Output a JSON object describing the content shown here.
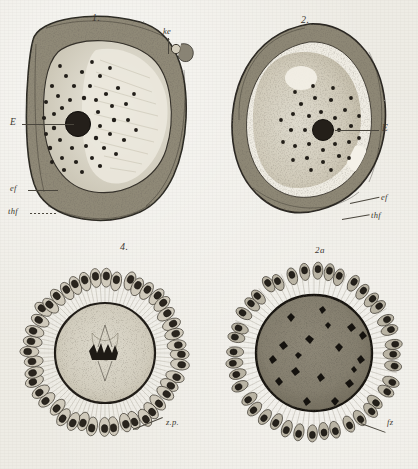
{
  "plate": {
    "title": "Histological plate of ovarian follicle sections",
    "background_color": "#eeece5",
    "ink_color": "#2b2823",
    "width": 418,
    "height": 469
  },
  "panels": [
    {
      "id": "panel-1",
      "fignum": "1.",
      "description": "Sectioned ovarian follicle with eccentric oocyte, dark nucleus and radiating granules",
      "labels": [
        {
          "name": "label-ke",
          "text": "ke"
        },
        {
          "name": "label-E",
          "text": "E"
        },
        {
          "name": "label-ef",
          "text": "ef"
        },
        {
          "name": "label-thf",
          "text": "thf"
        }
      ]
    },
    {
      "id": "panel-2",
      "fignum": "2.",
      "description": "Rounded follicle section with central nucleus surrounded by granule ring",
      "labels": [
        {
          "name": "label-E",
          "text": "E"
        },
        {
          "name": "label-ef",
          "text": "ef"
        },
        {
          "name": "label-thf",
          "text": "thf"
        }
      ]
    },
    {
      "id": "panel-4",
      "fignum": "4.",
      "description": "Radial corona of follicle cells around a stippled ovum containing a mitotic spindle",
      "labels": [
        {
          "name": "label-zp",
          "text": "z.p."
        }
      ]
    },
    {
      "id": "panel-2a",
      "fignum": "2a",
      "description": "Radial corona of follicle cells around a dark granular ovum",
      "labels": [
        {
          "name": "label-fz",
          "text": "fz"
        }
      ]
    }
  ]
}
